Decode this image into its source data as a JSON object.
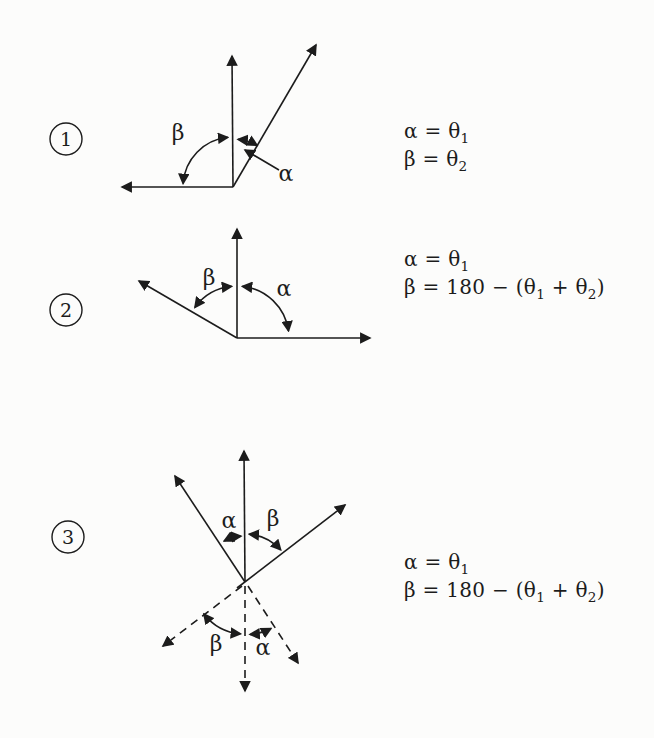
{
  "page": {
    "background": "#fcfcfb",
    "ink": "#1c1c1c"
  },
  "diagrams": [
    {
      "number": "1",
      "labels": {
        "alpha": "α",
        "beta": "β"
      },
      "equations": {
        "lines": [
          {
            "segs": [
              "α = θ",
              "1"
            ]
          },
          {
            "segs": [
              "β = θ",
              "2"
            ]
          }
        ]
      }
    },
    {
      "number": "2",
      "labels": {
        "alpha": "α",
        "beta": "β"
      },
      "equations": {
        "lines": [
          {
            "segs": [
              "α = θ",
              "1"
            ]
          },
          {
            "segs": [
              "β = 180 − (θ",
              "1",
              " + θ",
              "2",
              ")"
            ]
          }
        ]
      }
    },
    {
      "number": "3",
      "labels": {
        "alpha": "α",
        "beta": "β",
        "alpha_reflected": "α",
        "beta_reflected": "β"
      },
      "equations": {
        "lines": [
          {
            "segs": [
              "α = θ",
              "1"
            ]
          },
          {
            "segs": [
              "β = 180 − (θ",
              "1",
              " + θ",
              "2",
              ")"
            ]
          }
        ]
      }
    }
  ]
}
